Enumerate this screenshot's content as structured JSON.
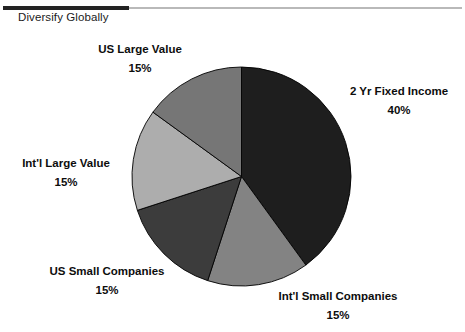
{
  "slide": {
    "title": "Diversify Globally",
    "background_color": "#ffffff",
    "rule_dark_color": "#232323",
    "rule_light_color": "#b9b9b9"
  },
  "chart_data": {
    "type": "pie",
    "title": "Diversify Globally",
    "xlabel": "",
    "ylabel": "",
    "legend_position": "none",
    "labels_outside": true,
    "start_angle_deg": 0,
    "direction": "clockwise",
    "categories": [
      "2 Yr Fixed Income",
      "Int'l Small Companies",
      "US Small Companies",
      "Int'l Large Value",
      "US Large Value"
    ],
    "values": [
      40,
      15,
      15,
      15,
      15
    ],
    "value_labels": [
      "40%",
      "15%",
      "15%",
      "15%",
      "15%"
    ],
    "colors": [
      "#1e1e1e",
      "#838383",
      "#3c3c3c",
      "#adadad",
      "#767676"
    ],
    "slices": [
      {
        "name": "2 Yr Fixed Income",
        "value": 40,
        "value_label": "40%",
        "color": "#1e1e1e",
        "start_deg": 0,
        "end_deg": 144
      },
      {
        "name": "Int'l Small Companies",
        "value": 15,
        "value_label": "15%",
        "color": "#838383",
        "start_deg": 144,
        "end_deg": 198
      },
      {
        "name": "US Small Companies",
        "value": 15,
        "value_label": "15%",
        "color": "#3c3c3c",
        "start_deg": 198,
        "end_deg": 252
      },
      {
        "name": "Int'l Large Value",
        "value": 15,
        "value_label": "15%",
        "color": "#adadad",
        "start_deg": 252,
        "end_deg": 306
      },
      {
        "name": "US Large Value",
        "value": 15,
        "value_label": "15%",
        "color": "#767676",
        "start_deg": 306,
        "end_deg": 360
      }
    ]
  },
  "callouts": {
    "us_large_value": {
      "label": "US Large Value",
      "percent": "15%"
    },
    "fixed_income": {
      "label": "2 Yr Fixed Income",
      "percent": "40%"
    },
    "intl_large_value": {
      "label": "Int'l Large Value",
      "percent": "15%"
    },
    "us_small": {
      "label": "US Small Companies",
      "percent": "15%"
    },
    "intl_small": {
      "label": "Int'l Small Companies",
      "percent": "15%"
    }
  }
}
